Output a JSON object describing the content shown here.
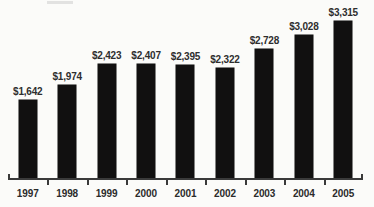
{
  "chart_data": {
    "type": "bar",
    "title": "",
    "subtitle": "",
    "xlabel": "",
    "ylabel": "",
    "categories": [
      "1997",
      "1998",
      "1999",
      "2000",
      "2001",
      "2002",
      "2003",
      "2004",
      "2005"
    ],
    "values": [
      1642,
      1974,
      2423,
      2407,
      2395,
      2322,
      2728,
      3028,
      3315
    ],
    "value_labels": [
      "$1,642",
      "$1,974",
      "$2,423",
      "$2,407",
      "$2,395",
      "$2,322",
      "$2,728",
      "$3,028",
      "$3,315"
    ],
    "series": [
      {
        "name": "",
        "values": [
          1642,
          1974,
          2423,
          2407,
          2395,
          2322,
          2728,
          3028,
          3315
        ]
      }
    ],
    "ylim": [
      0,
      3600
    ],
    "grid": false,
    "legend": false,
    "legend_position": "none",
    "bar_color": "#111010",
    "label_color": "#2e2e2e",
    "axis_color": "#3a3a3a",
    "background_color": "#fbfbf9",
    "annotations": []
  }
}
